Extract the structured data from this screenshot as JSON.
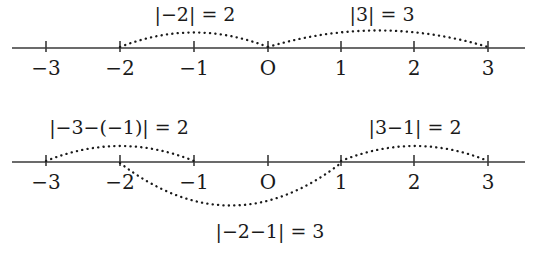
{
  "figure": {
    "background_color": "#ffffff",
    "ink_color": "#1a1a1a",
    "axis_color": "#3a3a3a"
  },
  "number_lines": [
    {
      "id": "number-line-top",
      "axis_y": 48,
      "tick_labels": [
        "−3",
        "−2",
        "−1",
        "O",
        "1",
        "2",
        "3"
      ],
      "tick_values": [
        -3,
        -2,
        -1,
        0,
        1,
        2,
        3
      ],
      "tick_x": [
        46,
        120,
        194,
        268,
        341,
        414,
        488
      ],
      "label_y": 58,
      "arcs": [
        {
          "name": "arc-neg2-to-0",
          "from_value": -2,
          "to_value": 0,
          "direction": "up",
          "label": "|−2| = 2",
          "label_x": 195,
          "label_y": 5
        },
        {
          "name": "arc-0-to-3",
          "from_value": 0,
          "to_value": 3,
          "direction": "up",
          "label": "|3| = 3",
          "label_x": 382,
          "label_y": 5
        }
      ]
    },
    {
      "id": "number-line-bottom",
      "axis_y": 162,
      "tick_labels": [
        "−3",
        "−2",
        "−1",
        "O",
        "1",
        "2",
        "3"
      ],
      "tick_values": [
        -3,
        -2,
        -1,
        0,
        1,
        2,
        3
      ],
      "tick_x": [
        46,
        120,
        194,
        268,
        341,
        414,
        488
      ],
      "label_y": 172,
      "arcs": [
        {
          "name": "arc-neg3-to-neg1",
          "from_value": -3,
          "to_value": -1,
          "direction": "up",
          "label": "|−3−(−1)| = 2",
          "label_x": 119,
          "label_y": 118
        },
        {
          "name": "arc-1-to-3",
          "from_value": 1,
          "to_value": 3,
          "direction": "up",
          "label": "|3−1| = 2",
          "label_x": 415,
          "label_y": 118
        },
        {
          "name": "arc-neg2-to-1",
          "from_value": -2,
          "to_value": 1,
          "direction": "down",
          "label": "|−2−1| = 3",
          "label_x": 270,
          "label_y": 222
        }
      ]
    }
  ]
}
